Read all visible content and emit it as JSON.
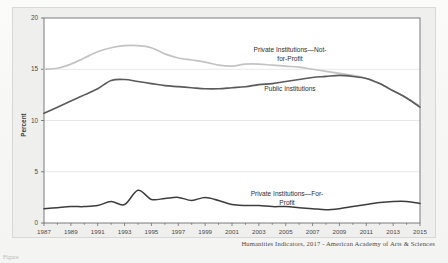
{
  "figure": {
    "caption": "Humanities Indicators, 2017 - American Academy of Arts & Sciences",
    "cut_off_note": "Figure"
  },
  "colors": {
    "public": "#5a5a5a",
    "not_for_profit": "#c3c3c3",
    "for_profit": "#3c3c3c",
    "grid": "#e2e2e2",
    "axis": "#6e6e6e",
    "plot_background": "#ffffff",
    "card_background": "#efefee"
  },
  "chart_data": {
    "type": "line",
    "title": "",
    "xlabel": "",
    "ylabel": "Percent",
    "xlim": [
      1987,
      2015
    ],
    "ylim": [
      0,
      20
    ],
    "yticks": [
      0,
      5,
      10,
      15,
      20
    ],
    "ytick_labels": [
      "0",
      "5",
      "10",
      "15",
      "20"
    ],
    "xticks": [
      1987,
      1989,
      1991,
      1993,
      1995,
      1997,
      1999,
      2001,
      2003,
      2005,
      2007,
      2009,
      2011,
      2013,
      2015
    ],
    "xtick_labels": [
      "1987",
      "1989",
      "1991",
      "1993",
      "1995",
      "1997",
      "1999",
      "2001",
      "2003",
      "2005",
      "2007",
      "2009",
      "2011",
      "2013",
      "2015"
    ],
    "grid": true,
    "legend": "inline-annotations",
    "x": [
      1987,
      1988,
      1989,
      1990,
      1991,
      1992,
      1993,
      1994,
      1995,
      1996,
      1997,
      1998,
      1999,
      2000,
      2001,
      2002,
      2003,
      2004,
      2005,
      2006,
      2007,
      2008,
      2009,
      2010,
      2011,
      2012,
      2013,
      2014,
      2015
    ],
    "series": [
      {
        "name": "Private Institutions—Not-for-Profit",
        "color": "#c3c3c3",
        "label_text": "Private Institutions—Not-for-Profit",
        "values": [
          15.0,
          15.1,
          15.5,
          16.1,
          16.7,
          17.1,
          17.3,
          17.3,
          17.1,
          16.5,
          16.1,
          15.9,
          15.7,
          15.4,
          15.3,
          15.5,
          15.5,
          15.4,
          15.3,
          15.2,
          15.0,
          14.8,
          14.6,
          14.4,
          14.1,
          13.6,
          12.9,
          12.2,
          11.4
        ]
      },
      {
        "name": "Public Institutions",
        "color": "#5a5a5a",
        "label_text": "Public Institutions",
        "values": [
          10.7,
          11.3,
          11.9,
          12.5,
          13.1,
          13.9,
          14.0,
          13.8,
          13.6,
          13.4,
          13.3,
          13.2,
          13.1,
          13.1,
          13.2,
          13.3,
          13.5,
          13.6,
          13.8,
          14.0,
          14.2,
          14.3,
          14.4,
          14.3,
          14.1,
          13.6,
          12.9,
          12.2,
          11.3
        ]
      },
      {
        "name": "Private Institutions—For-Profit",
        "color": "#3c3c3c",
        "label_text": "Private Institutions—For-Profit",
        "values": [
          1.4,
          1.5,
          1.6,
          1.6,
          1.7,
          2.1,
          1.8,
          3.2,
          2.3,
          2.4,
          2.5,
          2.2,
          2.5,
          2.2,
          1.8,
          1.7,
          1.7,
          1.6,
          1.6,
          1.5,
          1.4,
          1.3,
          1.4,
          1.6,
          1.8,
          2.0,
          2.1,
          2.1,
          1.9
        ]
      }
    ],
    "annotations": [
      {
        "name": "not-for-profit-label",
        "text_line1": "Private Institutions—Not-",
        "text_line2": "for-Profit"
      },
      {
        "name": "public-label",
        "text": "Public Institutions"
      },
      {
        "name": "for-profit-label",
        "text_line1": "Private Institutions—For-",
        "text_line2": "Profit"
      }
    ]
  }
}
